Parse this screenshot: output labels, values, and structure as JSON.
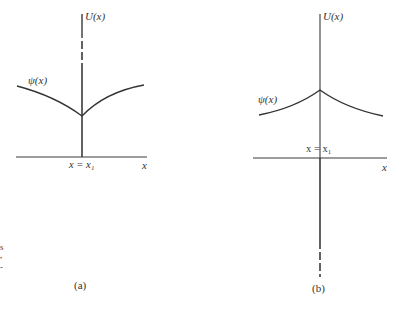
{
  "panels": [
    {
      "id": "a",
      "caption": "(a)",
      "vertical_axis_label": "U(x)",
      "wavefunction_label": "ψ(x)",
      "position_label": "x = x₁",
      "horizontal_axis_label": "x",
      "description": "Wavefunction with downward-pointing cusp (minimum) at x = x₁; potential drawn as upward line with dashed segment near top"
    },
    {
      "id": "b",
      "caption": "(b)",
      "vertical_axis_label": "U(x)",
      "wavefunction_label": "ψ(x)",
      "position_label": "x = x₁",
      "horizontal_axis_label": "x",
      "description": "Wavefunction with upward-pointing cusp (maximum) at x = x₁; potential drawn as downward line with dashed segment near bottom"
    }
  ],
  "margin_marks": [
    "s",
    "•",
    "-"
  ],
  "colors": {
    "line": "#3a3a3a",
    "curve": "#333333",
    "background": "#ffffff"
  }
}
